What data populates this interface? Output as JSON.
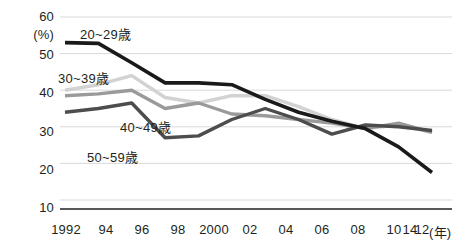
{
  "chart_data": {
    "type": "line",
    "title": "",
    "subtitle": "",
    "xlabel": "年",
    "ylabel": "(%)",
    "ylim": [
      10,
      60
    ],
    "yticks": [
      60,
      50,
      40,
      30,
      20,
      10
    ],
    "grid": true,
    "legend_position": "inline-labels",
    "x": [
      "1992",
      "94",
      "96",
      "98",
      "2000",
      "02",
      "04",
      "06",
      "08",
      "10",
      "12",
      "14"
    ],
    "categories": [
      "1992",
      "94",
      "96",
      "98",
      "2000",
      "02",
      "04",
      "06",
      "08",
      "10",
      "12",
      "14"
    ],
    "series": [
      {
        "name": "20~29歳",
        "color": "#1a1a1a",
        "width": 3.6,
        "values": [
          53.0,
          52.8,
          47.5,
          42.0,
          42.0,
          41.5,
          37.5,
          34.0,
          31.5,
          29.5,
          24.5,
          17.5
        ]
      },
      {
        "name": "30~39歳",
        "color": "#d2d2d2",
        "width": 3.4,
        "values": [
          40.0,
          41.5,
          44.0,
          38.0,
          36.5,
          38.5,
          38.5,
          35.5,
          32.0,
          29.5,
          30.5,
          28.5
        ]
      },
      {
        "name": "40~49歳",
        "color": "#9a9a9a",
        "width": 3.4,
        "values": [
          38.5,
          39.0,
          40.0,
          35.0,
          36.5,
          33.5,
          33.0,
          32.0,
          31.0,
          29.5,
          31.0,
          28.5
        ]
      },
      {
        "name": "50~59歳",
        "color": "#4d4d4d",
        "width": 3.4,
        "values": [
          34.0,
          35.0,
          36.5,
          27.0,
          27.5,
          32.0,
          35.0,
          32.0,
          28.0,
          30.5,
          30.0,
          29.0
        ]
      }
    ],
    "axis_unit_y": "(%)",
    "axis_unit_x": "(年)"
  },
  "labels": {
    "series_20_29": "20~29歳",
    "series_30_39": "30~39歳",
    "series_40_49": "40~49歳",
    "series_50_59": "50~59歳",
    "y_unit": "(%)",
    "x_unit": "(年)"
  }
}
